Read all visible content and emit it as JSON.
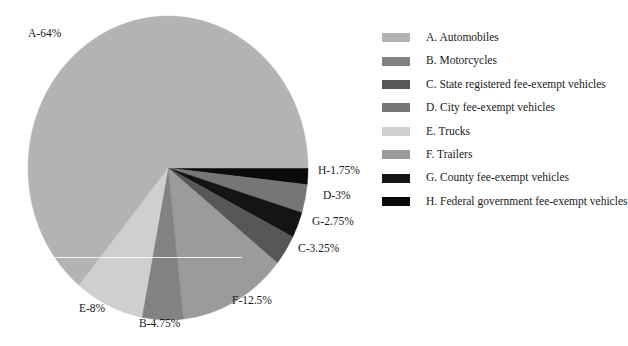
{
  "chart_data": {
    "type": "pie",
    "title": "",
    "subtitle": "",
    "xlabel": "",
    "ylabel": "",
    "grid": false,
    "legend_position": "right",
    "units": "percent",
    "start_angle_deg": 0,
    "direction": "clockwise",
    "total": 100,
    "categories": [
      "A. Automobiles",
      "B. Motorcycles",
      "C. State registered fee-exempt vehicles",
      "D. City fee-exempt vehicles",
      "E. Trucks",
      "F. Trailers",
      "G. County fee-exempt vehicles",
      "H. Federal government fee-exempt vehicles"
    ],
    "values": [
      64,
      4.75,
      3.25,
      3,
      8,
      12.5,
      2.75,
      1.75
    ],
    "slice_keys": [
      "A",
      "B",
      "C",
      "D",
      "E",
      "F",
      "G",
      "H"
    ],
    "colors": [
      "#b3b3b3",
      "#828282",
      "#575757",
      "#767676",
      "#cfcfcf",
      "#9b9b9b",
      "#141414",
      "#0a0a0a"
    ],
    "draw_order": [
      {
        "key": "H",
        "value": 1.75,
        "color": "#0a0a0a"
      },
      {
        "key": "D",
        "value": 3,
        "color": "#767676"
      },
      {
        "key": "G",
        "value": 2.75,
        "color": "#141414"
      },
      {
        "key": "C",
        "value": 3.25,
        "color": "#575757"
      },
      {
        "key": "F",
        "value": 12.5,
        "color": "#9b9b9b"
      },
      {
        "key": "B",
        "value": 4.75,
        "color": "#828282"
      },
      {
        "key": "E",
        "value": 8,
        "color": "#cfcfcf"
      },
      {
        "key": "A",
        "value": 64,
        "color": "#b3b3b3"
      }
    ],
    "data_labels": [
      "A-64%",
      "H-1.75%",
      "D-3%",
      "G-2.75%",
      "C-3.25%",
      "F-12.5%",
      "B-4.75%",
      "E-8%"
    ]
  },
  "pie": {
    "labels": {
      "a": "A-64%",
      "h": "H-1.75%",
      "d": "D-3%",
      "g": "G-2.75%",
      "c": "C-3.25%",
      "f": "F-12.5%",
      "b": "B-4.75%",
      "e": "E-8%"
    }
  },
  "legend": {
    "items": [
      {
        "key": "A",
        "label": "A. Automobiles",
        "color": "#b3b3b3"
      },
      {
        "key": "B",
        "label": "B. Motorcycles",
        "color": "#828282"
      },
      {
        "key": "C",
        "label": "C. State registered fee-exempt vehicles",
        "color": "#575757"
      },
      {
        "key": "D",
        "label": "D. City fee-exempt vehicles",
        "color": "#767676"
      },
      {
        "key": "E",
        "label": "E. Trucks",
        "color": "#cfcfcf"
      },
      {
        "key": "F",
        "label": "F. Trailers",
        "color": "#9b9b9b"
      },
      {
        "key": "G",
        "label": "G. County fee-exempt vehicles",
        "color": "#141414"
      },
      {
        "key": "H",
        "label": "H. Federal government fee-exempt vehicles",
        "color": "#0a0a0a"
      }
    ]
  }
}
